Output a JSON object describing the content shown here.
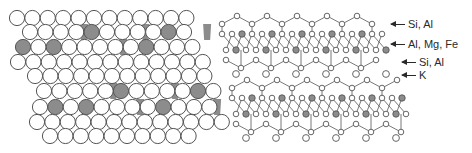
{
  "colors": {
    "outline": "#555555",
    "shaded": "#8c8c8c",
    "open": "#ffffff",
    "bond": "#6a6a6a",
    "text": "#2a2a2a"
  },
  "sphere_packing": {
    "radius": 7.6,
    "rows": [
      {
        "y": 18,
        "x0": 17,
        "n": 12,
        "dx": 15.4,
        "shaded": []
      },
      {
        "y": 32,
        "x0": 30,
        "n": 11,
        "dx": 15.4,
        "shaded": [
          4,
          9
        ],
        "gaps": [
          3,
          7,
          11
        ]
      },
      {
        "y": 47,
        "x0": 23,
        "n": 12,
        "dx": 15.4,
        "shaded": [
          0,
          2,
          8
        ],
        "gaps": [
          6
        ]
      },
      {
        "y": 62,
        "x0": 18,
        "n": 13,
        "dx": 15.4,
        "shaded": []
      },
      {
        "y": 76,
        "x0": 35,
        "n": 12,
        "dx": 15.4,
        "shaded": []
      },
      {
        "y": 91,
        "x0": 44,
        "n": 12,
        "dx": 15.4,
        "shaded": [
          5,
          10
        ],
        "gaps": [
          4,
          8
        ]
      },
      {
        "y": 107,
        "x0": 40,
        "n": 12,
        "dx": 15.4,
        "shaded": [
          1,
          3,
          8
        ],
        "gaps": [
          6,
          11
        ]
      },
      {
        "y": 122,
        "x0": 37,
        "n": 13,
        "dx": 15.4,
        "shaded": []
      },
      {
        "y": 136,
        "x0": 50,
        "n": 10,
        "dx": 15.4,
        "shaded": []
      }
    ]
  },
  "ball_and_stick": {
    "layers": [
      {
        "y_top": 20,
        "y_oct1": 34,
        "y_oct2": 50,
        "y_bot": 64,
        "x_start": 222,
        "x_end": 384,
        "k_row_y": 74
      },
      {
        "y_top": 84,
        "y_oct1": 98,
        "y_oct2": 114,
        "y_bot": 128,
        "x_start": 232,
        "x_end": 402,
        "k_row_y": 138
      }
    ],
    "cell_width": 30,
    "atom_radius": 2.8,
    "octa_radius": 3.2
  },
  "labels": [
    {
      "text": "Si, Al",
      "x": 391,
      "y": 24,
      "arrow_len": 14
    },
    {
      "text": "Al, Mg, Fe",
      "x": 391,
      "y": 44,
      "arrow_len": 14
    },
    {
      "text": "Si, Al",
      "x": 402,
      "y": 62,
      "arrow_len": 14
    },
    {
      "text": "K",
      "x": 402,
      "y": 75,
      "arrow_len": 14
    }
  ]
}
